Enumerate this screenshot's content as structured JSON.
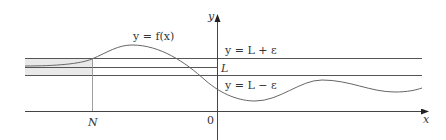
{
  "diagram": {
    "curve_label": "y = f(x)",
    "upper_line_label": "y = L + ε",
    "limit_label": "L",
    "lower_line_label": "y = L − ε",
    "x_axis_label": "x",
    "y_axis_label": "y",
    "origin_label": "0",
    "n_label": "N",
    "colors": {
      "lines": "#555555",
      "curve": "#666666",
      "band_fill": "#e9e9e9",
      "text": "#333333"
    }
  }
}
